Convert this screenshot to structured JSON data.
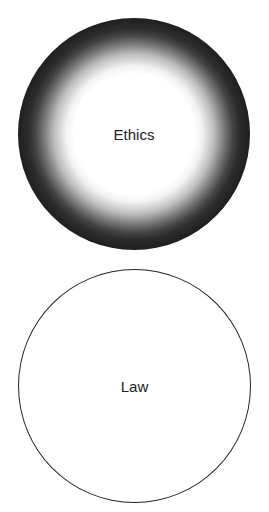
{
  "diagram": {
    "type": "concept-comparison",
    "shapes": [
      {
        "id": "ethics",
        "label": "Ethics",
        "shape": "circle",
        "style": "radial-gradient: white center fading to dark/black edge (fuzzy boundary)",
        "colors": {
          "center": "#ffffff",
          "edge": "#1f1f1f"
        }
      },
      {
        "id": "law",
        "label": "Law",
        "shape": "circle",
        "style": "white fill with crisp thin dark outline (sharp boundary)",
        "colors": {
          "fill": "#ffffff",
          "stroke": "#222222"
        }
      }
    ]
  }
}
